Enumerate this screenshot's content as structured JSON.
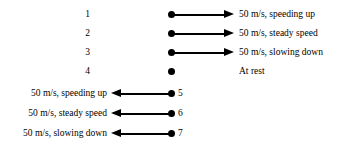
{
  "diagram": {
    "colors": {
      "ink": "#000000",
      "background": "#ffffff"
    },
    "rows": [
      {
        "number": "1",
        "number_side": "left",
        "marker": "filled-dot",
        "arrow": "right",
        "label": "50 m/s, speeding up",
        "label_side": "right"
      },
      {
        "number": "2",
        "number_side": "left",
        "marker": "filled-dot",
        "arrow": "right",
        "label": "50 m/s, steady speed",
        "label_side": "right"
      },
      {
        "number": "3",
        "number_side": "left",
        "marker": "filled-dot",
        "arrow": "right",
        "label": "50 m/s, slowing down",
        "label_side": "right"
      },
      {
        "number": "4",
        "number_side": "left",
        "marker": "filled-dot",
        "arrow": "none",
        "label": "At rest",
        "label_side": "right"
      },
      {
        "number": "5",
        "number_side": "right",
        "marker": "filled-dot",
        "arrow": "left",
        "label": "50 m/s, speeding up",
        "label_side": "left"
      },
      {
        "number": "6",
        "number_side": "right",
        "marker": "filled-dot",
        "arrow": "left",
        "label": "50 m/s, steady speed",
        "label_side": "left"
      },
      {
        "number": "7",
        "number_side": "right",
        "marker": "filled-dot",
        "arrow": "left",
        "label": "50 m/s, slowing down",
        "label_side": "left"
      }
    ]
  }
}
